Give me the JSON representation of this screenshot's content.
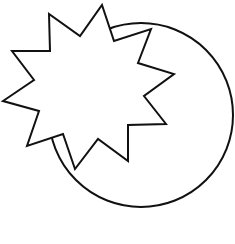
{
  "diagram": {
    "background": "#ffffff",
    "stroke_color": "#111111",
    "stroke_width": 2,
    "shapes": [
      {
        "type": "circle",
        "name": "circle",
        "cx": 141,
        "cy": 115,
        "r": 92,
        "fill": "#ffffff"
      },
      {
        "type": "star",
        "name": "ten-point-star",
        "points": "102,5 114,41 151,29 138,63 174,74 144,96 166,124 128,125 128,161 98,139 75,169 63,134 27,146 39,111 3,101 34,80 12,51 50,51 49,14 80,36",
        "fill": "#ffffff"
      }
    ]
  }
}
